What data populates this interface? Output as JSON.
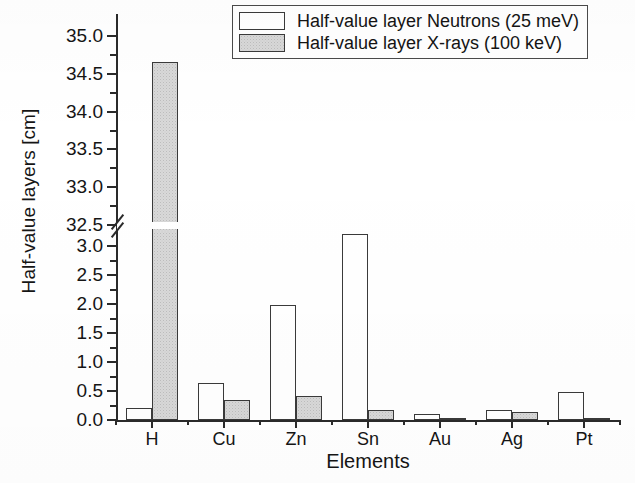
{
  "chart_data": {
    "type": "bar",
    "title": "",
    "xlabel": "Elements",
    "ylabel": "Half-value layers [cm]",
    "categories": [
      "H",
      "Cu",
      "Zn",
      "Sn",
      "Au",
      "Ag",
      "Pt"
    ],
    "series": [
      {
        "name": "Half-value layer Neutrons (25 meV)",
        "fill": "white",
        "values": [
          0.2,
          0.64,
          1.98,
          3.22,
          0.11,
          0.18,
          0.49
        ]
      },
      {
        "name": "Half-value layer X-rays (100 keV)",
        "fill": "#d9d9d9",
        "values": [
          34.65,
          0.35,
          0.42,
          0.17,
          0.02,
          0.13,
          0.015
        ]
      }
    ],
    "axis_break": true,
    "lower_ylim": [
      0.0,
      3.25
    ],
    "upper_ylim": [
      32.5,
      35.0
    ],
    "lower_yticks": [
      0.0,
      0.5,
      1.0,
      1.5,
      2.0,
      2.5,
      3.0
    ],
    "upper_yticks": [
      32.5,
      33.0,
      33.5,
      34.0,
      34.5,
      35.0
    ],
    "ytick_labels_lower": [
      "0.0",
      "0.5",
      "1.0",
      "1.5",
      "2.0",
      "2.5",
      "3.0"
    ],
    "ytick_labels_upper": [
      "32.5",
      "33.0",
      "33.5",
      "34.0",
      "34.5",
      "35.0"
    ],
    "grid": false,
    "legend_position": "top-right"
  },
  "legend": {
    "entries": [
      {
        "label": "Half-value layer Neutrons (25 meV)",
        "swatch": "neutron"
      },
      {
        "label": "Half-value layer X-rays (100 keV)",
        "swatch": "xray"
      }
    ]
  },
  "axes": {
    "y_title": "Half-value layers [cm]",
    "x_title": "Elements"
  }
}
